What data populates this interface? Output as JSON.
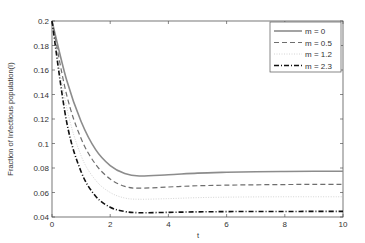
{
  "chart_data": {
    "type": "line",
    "title": "",
    "xlabel": "t",
    "ylabel": "Fraction of Infectious population(I)",
    "xlim": [
      0,
      10
    ],
    "ylim": [
      0.04,
      0.2
    ],
    "xticks": [
      0,
      2,
      4,
      6,
      8,
      10
    ],
    "yticks": [
      0.04,
      0.06,
      0.08,
      0.1,
      0.12,
      0.14,
      0.16,
      0.18,
      0.2
    ],
    "ytick_labels": [
      "0.04",
      "0.06",
      "0.08",
      "0.1",
      "0.12",
      "0.14",
      "0.16",
      "0.18",
      "0.2"
    ],
    "grid": false,
    "legend_position": "upper right",
    "x": [
      0,
      0.5,
      1,
      1.5,
      2,
      2.5,
      3,
      4,
      5,
      6,
      7,
      8,
      9,
      10
    ],
    "series": [
      {
        "name": "m = 0",
        "style": "solid",
        "color": "#8c8c8c",
        "values": [
          0.2,
          0.152,
          0.118,
          0.095,
          0.082,
          0.0755,
          0.0735,
          0.0745,
          0.0758,
          0.0765,
          0.077,
          0.0772,
          0.0773,
          0.0773
        ]
      },
      {
        "name": "m = 0.5",
        "style": "dashed",
        "color": "#6e6e6e",
        "values": [
          0.2,
          0.14,
          0.104,
          0.083,
          0.071,
          0.065,
          0.0635,
          0.0645,
          0.0655,
          0.066,
          0.0663,
          0.0665,
          0.0666,
          0.0666
        ]
      },
      {
        "name": "m = 1.2",
        "style": "dotted",
        "color": "#d4d4d4",
        "values": [
          0.2,
          0.13,
          0.09,
          0.07,
          0.06,
          0.0555,
          0.0545,
          0.055,
          0.0558,
          0.0562,
          0.0564,
          0.0565,
          0.0565,
          0.0565
        ]
      },
      {
        "name": "m = 2.3",
        "style": "dashdot",
        "color": "#111111",
        "values": [
          0.2,
          0.118,
          0.077,
          0.057,
          0.048,
          0.0445,
          0.0435,
          0.0438,
          0.0442,
          0.0444,
          0.0445,
          0.0445,
          0.0446,
          0.0446
        ]
      }
    ]
  }
}
